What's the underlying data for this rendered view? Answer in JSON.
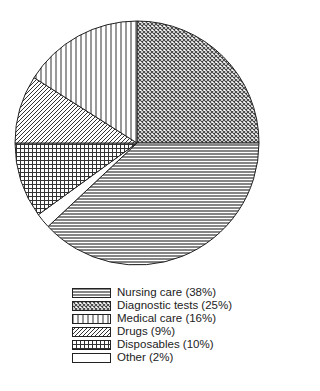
{
  "chart_data": {
    "type": "pie",
    "title": "",
    "slices": [
      {
        "label": "Diagnostic tests",
        "value": 25,
        "pattern": "crosshatch-diamond",
        "legend": "Diagnostic tests (25%)"
      },
      {
        "label": "Nursing care",
        "value": 38,
        "pattern": "horizontal-lines",
        "legend": "Nursing care (38%)"
      },
      {
        "label": "Other",
        "value": 2,
        "pattern": "blank",
        "legend": "Other (2%)"
      },
      {
        "label": "Disposables",
        "value": 10,
        "pattern": "grid",
        "legend": "Disposables (10%)"
      },
      {
        "label": "Drugs",
        "value": 9,
        "pattern": "diagonal-lines",
        "legend": "Drugs (9%)"
      },
      {
        "label": "Medical care",
        "value": 16,
        "pattern": "vertical-lines",
        "legend": "Medical care (16%)"
      }
    ],
    "start_angle": "12 o'clock",
    "direction": "clockwise",
    "legend_position": "bottom"
  },
  "legend": {
    "items": [
      {
        "label": "Nursing care (38%)",
        "pattern": "horizontal-lines"
      },
      {
        "label": "Diagnostic tests (25%)",
        "pattern": "crosshatch-diamond"
      },
      {
        "label": "Medical care (16%)",
        "pattern": "vertical-lines"
      },
      {
        "label": "Drugs (9%)",
        "pattern": "diagonal-lines"
      },
      {
        "label": "Disposables (10%)",
        "pattern": "grid"
      },
      {
        "label": "Other (2%)",
        "pattern": "blank"
      }
    ]
  }
}
